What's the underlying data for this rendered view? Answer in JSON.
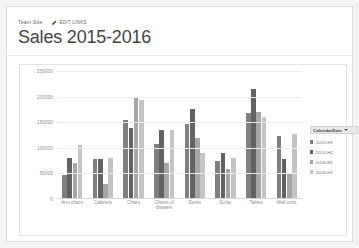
{
  "header": {
    "breadcrumb": "Team Site",
    "edit_links_label": "EDIT LINKS",
    "pencil_icon": "pencil-icon",
    "title": "Sales 2015-2016"
  },
  "filter": {
    "label": "Products",
    "caret_icon": "chevron-down-icon"
  },
  "legend": {
    "title": "CalendarDate",
    "caret_icon": "chevron-down-icon"
  },
  "colors": {
    "series_1": "#7f7f7f",
    "series_2": "#626262",
    "series_3": "#a6a6a6",
    "series_4": "#c4c4c4",
    "gridline": "#ededed",
    "axis": "#d9d9d9",
    "tick_text": "#8a8a8a",
    "title_text": "#444444"
  },
  "chart_data": {
    "type": "bar",
    "title": "",
    "xlabel": "",
    "ylabel": "",
    "ylim": [
      0,
      250000
    ],
    "yticks": [
      250000,
      200000,
      150000,
      100000,
      50000,
      0
    ],
    "ytick_labels": [
      "250000",
      "200000",
      "150000",
      "100000",
      "50000",
      "0"
    ],
    "grid": true,
    "legend_position": "right",
    "legend_title": "CalendarDate",
    "categories": [
      "Arm chairs",
      "Cabinets",
      "Chairs",
      "Chests of drawers",
      "Desks",
      "Sofas",
      "Tables",
      "Wall units"
    ],
    "series": [
      {
        "name": "2015-H1",
        "color": "#7f7f7f",
        "values": [
          47000,
          78000,
          155000,
          107000,
          146000,
          75000,
          168000,
          124000
        ]
      },
      {
        "name": "2015-H2",
        "color": "#626262",
        "values": [
          80000,
          78000,
          138000,
          135000,
          175000,
          90000,
          215000,
          78000
        ]
      },
      {
        "name": "2016-H1",
        "color": "#a6a6a6",
        "values": [
          71000,
          29000,
          197000,
          70000,
          120000,
          58000,
          170000,
          48000
        ]
      },
      {
        "name": "2016-H2",
        "color": "#c4c4c4",
        "values": [
          105000,
          81000,
          193000,
          134000,
          89000,
          80000,
          160000,
          127000
        ]
      }
    ]
  }
}
